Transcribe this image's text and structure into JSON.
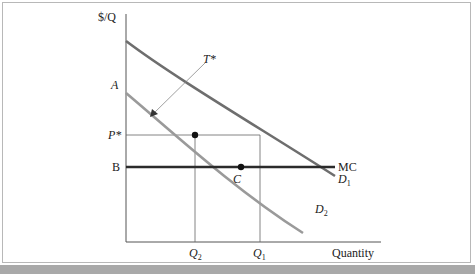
{
  "diagram": {
    "y_axis_label": "$/Q",
    "x_axis_label": "Quantity",
    "price_labels": {
      "a": "A",
      "p_star": "P*",
      "b": "B"
    },
    "quantity_labels": {
      "q2": "Q",
      "q2_sub": "2",
      "q1": "Q",
      "q1_sub": "1"
    },
    "curves": {
      "d1": {
        "label": "D",
        "sub": "1",
        "color": "#6e6e6e"
      },
      "d2": {
        "label": "D",
        "sub": "2",
        "color": "#9a9a9a"
      },
      "mc": {
        "label": "MC",
        "color": "#2b2b2b"
      }
    },
    "points": {
      "c": "C"
    },
    "shift_arrow": {
      "label": "T*"
    },
    "colors": {
      "axis": "#555555",
      "guide": "#777777",
      "frame": "#b8b8b8",
      "bottom_bar": "#a9a9a9"
    }
  }
}
